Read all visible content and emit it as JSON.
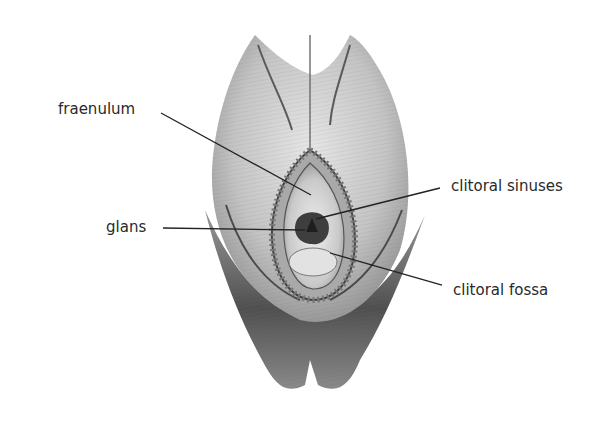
{
  "figure": {
    "type": "anatomical-illustration",
    "style": "monochrome engraving",
    "colors": {
      "background": "#ffffff",
      "ink": "#2a2a2a",
      "shade_light": "#d9d9d9",
      "shade_mid": "#a8a8a8",
      "shade_dark": "#555555"
    }
  },
  "labels": [
    {
      "id": "fraenulum",
      "text": "fraenulum",
      "x": 58,
      "y": 102,
      "line": [
        161,
        113,
        311,
        195
      ]
    },
    {
      "id": "glans",
      "text": "glans",
      "x": 106,
      "y": 220,
      "line": [
        163,
        228,
        305,
        230
      ]
    },
    {
      "id": "clitoral-sinuses",
      "text": "clitoral sinuses",
      "x": 451,
      "y": 179,
      "line": [
        440,
        188,
        316,
        219
      ]
    },
    {
      "id": "clitoral-fossa",
      "text": "clitoral fossa",
      "x": 453,
      "y": 283,
      "line": [
        442,
        285,
        330,
        253
      ]
    }
  ]
}
